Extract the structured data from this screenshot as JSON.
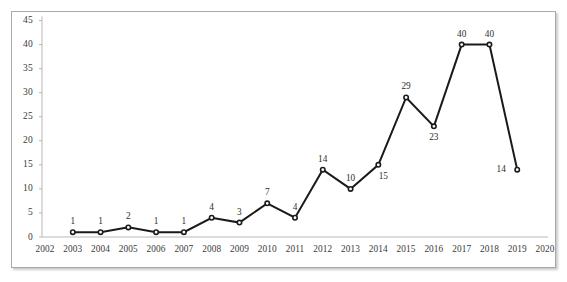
{
  "chart_data": {
    "type": "line",
    "title": "",
    "subtitle": "",
    "xlabel": "",
    "ylabel": "",
    "grid": false,
    "legend": "none",
    "marker": "filled-circle",
    "line_color": "#1a1a1a",
    "axis_color": "#b0b0b0",
    "text_color": "#3a3a3a",
    "xlim": [
      2002,
      2020
    ],
    "ylim": [
      0,
      45
    ],
    "x_ticks": [
      "2002",
      "2003",
      "2004",
      "2005",
      "2006",
      "2007",
      "2008",
      "2009",
      "2010",
      "2011",
      "2012",
      "2013",
      "2014",
      "2015",
      "2016",
      "2017",
      "2018",
      "2019",
      "2020"
    ],
    "y_ticks": [
      "0",
      "5",
      "10",
      "15",
      "20",
      "25",
      "30",
      "35",
      "40",
      "45"
    ],
    "categories": [
      2003,
      2004,
      2005,
      2006,
      2007,
      2008,
      2009,
      2010,
      2011,
      2012,
      2013,
      2014,
      2015,
      2016,
      2017,
      2018,
      2019
    ],
    "values": [
      1,
      1,
      2,
      1,
      1,
      4,
      3,
      7,
      4,
      14,
      10,
      15,
      29,
      23,
      40,
      40,
      14
    ],
    "point_labels": [
      {
        "x": 2003,
        "y": 1,
        "text": "1",
        "pos": "above"
      },
      {
        "x": 2004,
        "y": 1,
        "text": "1",
        "pos": "above"
      },
      {
        "x": 2005,
        "y": 2,
        "text": "2",
        "pos": "above"
      },
      {
        "x": 2006,
        "y": 1,
        "text": "1",
        "pos": "above"
      },
      {
        "x": 2007,
        "y": 1,
        "text": "1",
        "pos": "above"
      },
      {
        "x": 2008,
        "y": 4,
        "text": "4",
        "pos": "above"
      },
      {
        "x": 2009,
        "y": 3,
        "text": "3",
        "pos": "above"
      },
      {
        "x": 2010,
        "y": 7,
        "text": "7",
        "pos": "above"
      },
      {
        "x": 2011,
        "y": 4,
        "text": "4",
        "pos": "above"
      },
      {
        "x": 2012,
        "y": 14,
        "text": "14",
        "pos": "above"
      },
      {
        "x": 2013,
        "y": 10,
        "text": "10",
        "pos": "above"
      },
      {
        "x": 2014,
        "y": 15,
        "text": "15",
        "pos": "below-right"
      },
      {
        "x": 2015,
        "y": 29,
        "text": "29",
        "pos": "above"
      },
      {
        "x": 2016,
        "y": 23,
        "text": "23",
        "pos": "below"
      },
      {
        "x": 2017,
        "y": 40,
        "text": "40",
        "pos": "above"
      },
      {
        "x": 2018,
        "y": 40,
        "text": "40",
        "pos": "above"
      },
      {
        "x": 2019,
        "y": 14,
        "text": "14",
        "pos": "left"
      }
    ]
  }
}
